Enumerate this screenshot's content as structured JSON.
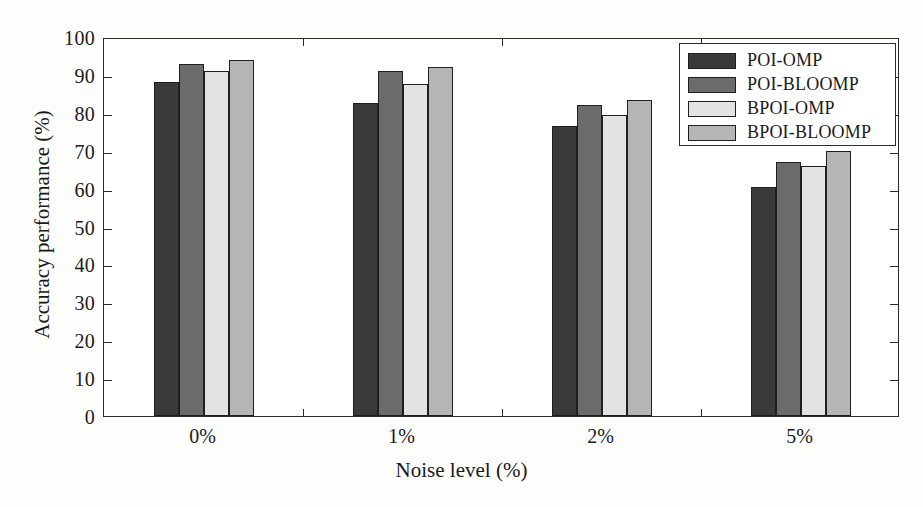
{
  "chart_data": {
    "type": "bar",
    "title": "",
    "xlabel": "Noise level (%)",
    "ylabel": "Accuracy performance (%)",
    "categories": [
      "0%",
      "1%",
      "2%",
      "5%"
    ],
    "ylim": [
      0,
      100
    ],
    "yticks": [
      0,
      10,
      20,
      30,
      40,
      50,
      60,
      70,
      80,
      90,
      100
    ],
    "ytick_labels": [
      "0",
      "10",
      "20",
      "30",
      "40",
      "50",
      "60",
      "70",
      "80",
      "90",
      "100"
    ],
    "grid": false,
    "legend_position": "top-right",
    "series": [
      {
        "name": "POI-OMP",
        "color": "#3a3a3a",
        "values": [
          88.0,
          82.5,
          76.5,
          60.5
        ]
      },
      {
        "name": "POI-BLOOMP",
        "color": "#6b6b6b",
        "values": [
          93.0,
          91.0,
          82.0,
          67.0
        ]
      },
      {
        "name": "BPOI-OMP",
        "color": "#e3e3e3",
        "values": [
          91.0,
          87.5,
          79.5,
          66.0
        ]
      },
      {
        "name": "BPOI-BLOOMP",
        "color": "#b5b5b5",
        "values": [
          94.0,
          92.0,
          83.5,
          70.0
        ]
      }
    ]
  },
  "legend": {
    "items": [
      {
        "label": "POI-OMP"
      },
      {
        "label": "POI-BLOOMP"
      },
      {
        "label": "BPOI-OMP"
      },
      {
        "label": "BPOI-BLOOMP"
      }
    ]
  }
}
